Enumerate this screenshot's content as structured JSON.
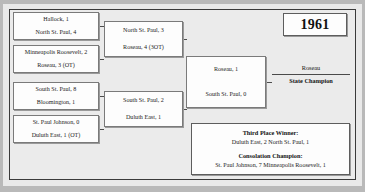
{
  "year": "1961",
  "bracket": {
    "round1": [
      {
        "top": "Hallock, 1",
        "bottom": "North St. Paul, 4"
      },
      {
        "top": "Minneapolis Roosevelt, 2",
        "bottom": "Roseau, 3 (OT)"
      },
      {
        "top": "South St. Paul, 8",
        "bottom": "Bloomington, 1"
      },
      {
        "top": "St. Paul Johnson, 0",
        "bottom": "Duluth East, 1 (OT)"
      }
    ],
    "round2": [
      {
        "top": "North St. Paul, 3",
        "bottom": "Roseau, 4 (3OT)"
      },
      {
        "top": "South St. Paul, 2",
        "bottom": "Duluth East, 1"
      }
    ],
    "final": {
      "top": "Roseau, 1",
      "bottom": "South St. Paul, 0"
    },
    "champion": {
      "name": "Roseau",
      "title": "State Champion"
    }
  },
  "results": {
    "third_place": {
      "title": "Third Place Winner:",
      "line": "Duluth East, 2  North St. Paul, 1"
    },
    "consolation": {
      "title": "Consolation Champion:",
      "line": "St. Paul Johnson, 7  Minneapolis Roosevelt, 1"
    }
  },
  "colors": {
    "page_background": "#b9b9b9",
    "panel_background": "#ebebeb",
    "box_fill": "#fdfdfd",
    "line": "#4d4d4d",
    "text": "#1c1c1c"
  }
}
